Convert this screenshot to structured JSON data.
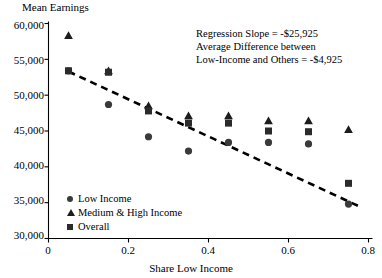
{
  "chart_data": {
    "type": "scatter",
    "title": "",
    "ylabel": "Mean Earnings",
    "xlabel": "Share Low Income",
    "xlim": [
      0,
      0.8
    ],
    "ylim": [
      30000,
      60000
    ],
    "grid": false,
    "xticks": [
      "0",
      "0.2",
      "0.4",
      "0.6",
      "0.8"
    ],
    "xtick_values": [
      0,
      0.2,
      0.4,
      0.6,
      0.8
    ],
    "yticks": [
      "30,000",
      "35,000",
      "40,000",
      "45,000",
      "50,000",
      "55,000",
      "60,000"
    ],
    "ytick_values": [
      30000,
      35000,
      40000,
      45000,
      50000,
      55000,
      60000
    ],
    "x": [
      0.05,
      0.15,
      0.25,
      0.35,
      0.45,
      0.55,
      0.65,
      0.75
    ],
    "series": [
      {
        "name": "Low Income",
        "marker": "circle",
        "color": "#3a3a3a",
        "values": [
          53400,
          48700,
          44200,
          42200,
          43400,
          43400,
          43200,
          34800
        ]
      },
      {
        "name": "Medium & High Income",
        "marker": "triangle",
        "color": "#1c1c1c",
        "values": [
          58300,
          53400,
          48500,
          47100,
          47100,
          46400,
          46400,
          45200
        ]
      },
      {
        "name": "Overall",
        "marker": "square",
        "color": "#2b2b2b",
        "values": [
          53400,
          53200,
          47800,
          46100,
          46100,
          45000,
          44900,
          37700
        ]
      }
    ],
    "trendline": {
      "name": "regression-line",
      "style": "dashed",
      "color": "#000000",
      "x_start": 0.05,
      "y_start": 53300,
      "x_end": 0.78,
      "y_end": 34400
    },
    "legend": {
      "position": "inside-bottom-left",
      "entries": [
        {
          "label": "Low Income",
          "marker": "circle"
        },
        {
          "label": "Medium & High Income",
          "marker": "triangle"
        },
        {
          "label": "Overall",
          "marker": "square"
        }
      ]
    },
    "annotations": [
      "Regression Slope = -$25,925",
      "Average Difference between",
      "Low-Income and Others = -$4,925"
    ]
  }
}
